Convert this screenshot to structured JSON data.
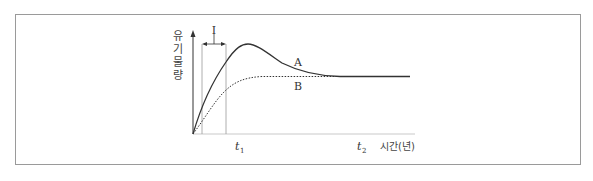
{
  "diagram": {
    "y_axis_label_chars": [
      "유",
      "기",
      "물",
      "량"
    ],
    "y_axis_label": "유기물량",
    "x_axis_label": "시간(년)",
    "interval_label": "I",
    "curves": [
      {
        "name": "A",
        "label": "A",
        "style": "solid"
      },
      {
        "name": "B",
        "label": "B",
        "style": "dotted"
      }
    ],
    "ticks": [
      {
        "label": "t",
        "sub": "1"
      },
      {
        "label": "t",
        "sub": "2"
      }
    ],
    "colors": {
      "line": "#333333",
      "frame": "#9a9a9a",
      "guide": "#9a9a9a"
    }
  }
}
